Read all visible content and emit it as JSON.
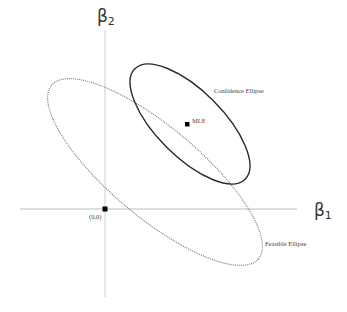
{
  "diagram": {
    "axes": {
      "x_label_base": "β",
      "x_label_sub": "1",
      "y_label_base": "β",
      "y_label_sub": "2",
      "color": "#bdbdbd"
    },
    "points": {
      "origin_label": "(0,0)",
      "mle_label": "MLE"
    },
    "ellipses": {
      "confidence_label": "Confidence Ellipse",
      "confidence_style": "solid",
      "confidence_color": "#2b2b2b",
      "feasible_label": "Feasible Ellipse",
      "feasible_style": "dotted",
      "feasible_color": "#777777"
    }
  }
}
